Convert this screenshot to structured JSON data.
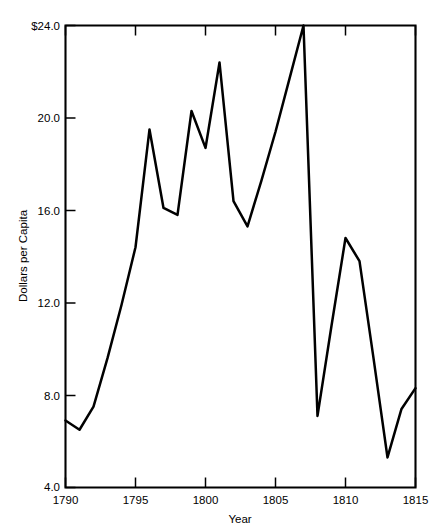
{
  "chart_data": {
    "type": "line",
    "title": "",
    "xlabel": "Year",
    "ylabel": "Dollars per Capita",
    "xlim": [
      1790,
      1815
    ],
    "ylim": [
      4.0,
      24.0
    ],
    "grid": false,
    "legend": null,
    "x_ticks": [
      1790,
      1795,
      1800,
      1805,
      1810,
      1815
    ],
    "x_tick_labels": [
      "1790",
      "1795",
      "1800",
      "1805",
      "1810",
      "1815"
    ],
    "y_ticks": [
      4.0,
      8.0,
      12.0,
      16.0,
      20.0,
      24.0
    ],
    "y_tick_labels": [
      "4.0",
      "8.0",
      "12.0",
      "16.0",
      "20.0",
      "$24.0"
    ],
    "series": [
      {
        "name": "Dollars per Capita",
        "color": "#000000",
        "x": [
          1790,
          1791,
          1792,
          1793,
          1794,
          1795,
          1796,
          1797,
          1798,
          1799,
          1800,
          1801,
          1802,
          1803,
          1804,
          1805,
          1806,
          1807,
          1808,
          1809,
          1810,
          1811,
          1812,
          1813,
          1814,
          1815
        ],
        "values": [
          6.9,
          6.5,
          7.5,
          9.6,
          11.9,
          14.4,
          19.5,
          16.1,
          15.8,
          20.3,
          18.7,
          22.4,
          16.4,
          15.3,
          17.3,
          19.4,
          21.7,
          24.0,
          7.1,
          11.0,
          14.8,
          13.8,
          9.6,
          5.3,
          7.4,
          8.3
        ]
      }
    ]
  },
  "axes": {
    "y_axis_label": "Dollars per Capita",
    "x_axis_label": "Year"
  }
}
